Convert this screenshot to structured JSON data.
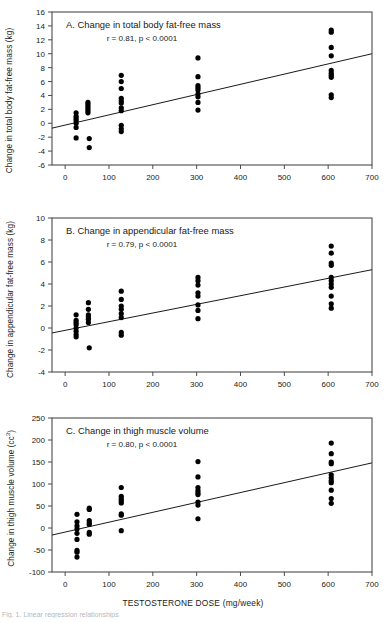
{
  "figure": {
    "xaxis_title": "TESTOSTERONE DOSE (mg/week)",
    "caption": "Fig. 1. Linear regression relationships"
  },
  "chart_data": [
    {
      "type": "scatter",
      "panel": "A",
      "title": "A.  Change in total body fat-free mass",
      "stat": "r = 0.81, p < 0.0001",
      "xlabel": "TESTOSTERONE DOSE (mg/week)",
      "ylabel": "Change in total body fat-free mass (kg)",
      "xlim": [
        -30,
        700
      ],
      "ylim": [
        -6,
        16
      ],
      "xticks": [
        0,
        100,
        200,
        300,
        400,
        500,
        600,
        700
      ],
      "yticks": [
        -6,
        -4,
        -2,
        0,
        2,
        4,
        6,
        8,
        10,
        12,
        14,
        16
      ],
      "grid": false,
      "legend": "none",
      "fit_line": {
        "x0": -30,
        "y0": -0.7,
        "x1": 700,
        "y1": 10.0
      },
      "points": [
        {
          "x": 25,
          "y": 1.5
        },
        {
          "x": 25,
          "y": 1.0
        },
        {
          "x": 25,
          "y": 0.7
        },
        {
          "x": 25,
          "y": 0.4
        },
        {
          "x": 25,
          "y": 0.0
        },
        {
          "x": 25,
          "y": -0.6
        },
        {
          "x": 25,
          "y": -2.1
        },
        {
          "x": 52,
          "y": 3.0
        },
        {
          "x": 52,
          "y": 2.7
        },
        {
          "x": 52,
          "y": 2.4
        },
        {
          "x": 52,
          "y": 2.1
        },
        {
          "x": 52,
          "y": 1.8
        },
        {
          "x": 52,
          "y": 1.5
        },
        {
          "x": 55,
          "y": -2.2
        },
        {
          "x": 55,
          "y": -3.5
        },
        {
          "x": 128,
          "y": 6.9
        },
        {
          "x": 128,
          "y": 6.0
        },
        {
          "x": 128,
          "y": 5.0
        },
        {
          "x": 128,
          "y": 3.6
        },
        {
          "x": 128,
          "y": 3.2
        },
        {
          "x": 128,
          "y": 2.9
        },
        {
          "x": 128,
          "y": 2.2
        },
        {
          "x": 128,
          "y": 1.8
        },
        {
          "x": 128,
          "y": -0.3
        },
        {
          "x": 128,
          "y": -0.8
        },
        {
          "x": 128,
          "y": -1.2
        },
        {
          "x": 303,
          "y": 9.4
        },
        {
          "x": 303,
          "y": 6.7
        },
        {
          "x": 303,
          "y": 5.4
        },
        {
          "x": 303,
          "y": 5.1
        },
        {
          "x": 303,
          "y": 4.8
        },
        {
          "x": 303,
          "y": 4.2
        },
        {
          "x": 303,
          "y": 3.8
        },
        {
          "x": 303,
          "y": 3.0
        },
        {
          "x": 303,
          "y": 1.9
        },
        {
          "x": 607,
          "y": 13.4
        },
        {
          "x": 607,
          "y": 13.1
        },
        {
          "x": 607,
          "y": 10.9
        },
        {
          "x": 607,
          "y": 9.7
        },
        {
          "x": 607,
          "y": 7.6
        },
        {
          "x": 607,
          "y": 7.2
        },
        {
          "x": 607,
          "y": 6.9
        },
        {
          "x": 607,
          "y": 6.6
        },
        {
          "x": 607,
          "y": 4.1
        },
        {
          "x": 607,
          "y": 3.7
        }
      ]
    },
    {
      "type": "scatter",
      "panel": "B",
      "title": "B.  Change in appendicular fat-free mass",
      "stat": "r = 0.79, p < 0.0001",
      "xlabel": "TESTOSTERONE DOSE (mg/week)",
      "ylabel": "Change in appendicular fat-free mass (kg)",
      "xlim": [
        -30,
        700
      ],
      "ylim": [
        -4,
        10
      ],
      "xticks": [
        0,
        100,
        200,
        300,
        400,
        500,
        600,
        700
      ],
      "yticks": [
        -4,
        -2,
        0,
        2,
        4,
        6,
        8,
        10
      ],
      "grid": false,
      "legend": "none",
      "fit_line": {
        "x0": -30,
        "y0": -0.45,
        "x1": 700,
        "y1": 5.3
      },
      "points": [
        {
          "x": 25,
          "y": 1.2
        },
        {
          "x": 25,
          "y": 0.7
        },
        {
          "x": 25,
          "y": 0.5
        },
        {
          "x": 25,
          "y": 0.3
        },
        {
          "x": 25,
          "y": 0.0
        },
        {
          "x": 25,
          "y": -0.3
        },
        {
          "x": 25,
          "y": -0.6
        },
        {
          "x": 25,
          "y": -0.8
        },
        {
          "x": 53,
          "y": 2.3
        },
        {
          "x": 53,
          "y": 1.7
        },
        {
          "x": 53,
          "y": 1.2
        },
        {
          "x": 53,
          "y": 1.0
        },
        {
          "x": 53,
          "y": 0.8
        },
        {
          "x": 53,
          "y": 0.5
        },
        {
          "x": 55,
          "y": -1.8
        },
        {
          "x": 128,
          "y": 3.35
        },
        {
          "x": 128,
          "y": 2.6
        },
        {
          "x": 128,
          "y": 2.0
        },
        {
          "x": 128,
          "y": 1.7
        },
        {
          "x": 128,
          "y": 1.3
        },
        {
          "x": 128,
          "y": 0.95
        },
        {
          "x": 128,
          "y": -0.4
        },
        {
          "x": 128,
          "y": -0.65
        },
        {
          "x": 303,
          "y": 4.6
        },
        {
          "x": 303,
          "y": 4.3
        },
        {
          "x": 303,
          "y": 3.9
        },
        {
          "x": 303,
          "y": 3.2
        },
        {
          "x": 303,
          "y": 2.9
        },
        {
          "x": 303,
          "y": 2.1
        },
        {
          "x": 303,
          "y": 1.6
        },
        {
          "x": 303,
          "y": 0.85
        },
        {
          "x": 607,
          "y": 7.45
        },
        {
          "x": 607,
          "y": 6.8
        },
        {
          "x": 607,
          "y": 5.9
        },
        {
          "x": 607,
          "y": 5.7
        },
        {
          "x": 607,
          "y": 4.6
        },
        {
          "x": 607,
          "y": 4.3
        },
        {
          "x": 607,
          "y": 4.0
        },
        {
          "x": 607,
          "y": 3.7
        },
        {
          "x": 607,
          "y": 2.9
        },
        {
          "x": 607,
          "y": 2.2
        },
        {
          "x": 607,
          "y": 1.8
        }
      ]
    },
    {
      "type": "scatter",
      "panel": "C",
      "title": "C.  Change in thigh muscle volume",
      "stat": "r = 0.80, p < 0.0001",
      "xlabel": "TESTOSTERONE DOSE (mg/week)",
      "ylabel": "Change in thigh muscle volume (cc)",
      "xlim": [
        -30,
        700
      ],
      "ylim": [
        -100,
        250
      ],
      "xticks": [
        0,
        100,
        200,
        300,
        400,
        500,
        600,
        700
      ],
      "yticks": [
        -100,
        -50,
        0,
        50,
        100,
        150,
        200,
        250
      ],
      "grid": false,
      "legend": "none",
      "fit_line": {
        "x0": -30,
        "y0": -16,
        "x1": 700,
        "y1": 148
      },
      "points": [
        {
          "x": 27,
          "y": 31
        },
        {
          "x": 27,
          "y": 14
        },
        {
          "x": 27,
          "y": 5
        },
        {
          "x": 27,
          "y": -2
        },
        {
          "x": 27,
          "y": -12
        },
        {
          "x": 27,
          "y": -26
        },
        {
          "x": 27,
          "y": -51
        },
        {
          "x": 27,
          "y": -55
        },
        {
          "x": 27,
          "y": -66
        },
        {
          "x": 55,
          "y": 45
        },
        {
          "x": 55,
          "y": 42
        },
        {
          "x": 55,
          "y": 17
        },
        {
          "x": 55,
          "y": 12
        },
        {
          "x": 55,
          "y": 8
        },
        {
          "x": 55,
          "y": -10
        },
        {
          "x": 55,
          "y": -14
        },
        {
          "x": 128,
          "y": 92
        },
        {
          "x": 128,
          "y": 72
        },
        {
          "x": 128,
          "y": 66
        },
        {
          "x": 128,
          "y": 62
        },
        {
          "x": 128,
          "y": 57
        },
        {
          "x": 128,
          "y": 32
        },
        {
          "x": 128,
          "y": 29
        },
        {
          "x": 128,
          "y": -6
        },
        {
          "x": 303,
          "y": 151
        },
        {
          "x": 303,
          "y": 116
        },
        {
          "x": 303,
          "y": 92
        },
        {
          "x": 303,
          "y": 85
        },
        {
          "x": 303,
          "y": 80
        },
        {
          "x": 303,
          "y": 76
        },
        {
          "x": 303,
          "y": 59
        },
        {
          "x": 303,
          "y": 52
        },
        {
          "x": 303,
          "y": 21
        },
        {
          "x": 607,
          "y": 193
        },
        {
          "x": 607,
          "y": 169
        },
        {
          "x": 607,
          "y": 150
        },
        {
          "x": 607,
          "y": 146
        },
        {
          "x": 607,
          "y": 121
        },
        {
          "x": 607,
          "y": 114
        },
        {
          "x": 607,
          "y": 108
        },
        {
          "x": 607,
          "y": 103
        },
        {
          "x": 607,
          "y": 86
        },
        {
          "x": 607,
          "y": 67
        },
        {
          "x": 607,
          "y": 56
        }
      ]
    }
  ]
}
